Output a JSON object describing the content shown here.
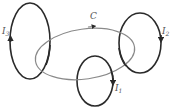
{
  "diagram": {
    "path": {
      "label": "C",
      "color": "#8a8a8a"
    },
    "currents": [
      {
        "id": "I1",
        "symbol": "I",
        "subscript": "1",
        "color": "#2a2a2a"
      },
      {
        "id": "I2",
        "symbol": "I",
        "subscript": "2",
        "color": "#2a2a2a"
      },
      {
        "id": "I3",
        "symbol": "I",
        "subscript": "3",
        "color": "#2a2a2a"
      }
    ]
  }
}
